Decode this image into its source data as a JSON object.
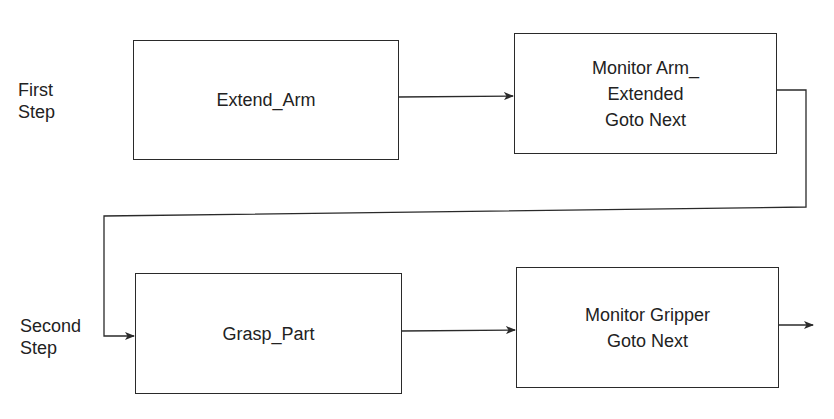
{
  "diagram": {
    "type": "flowchart",
    "steps": [
      {
        "label_lines": [
          "First",
          "Step"
        ],
        "boxes": [
          {
            "id": "extend_arm",
            "lines": [
              "Extend_Arm"
            ]
          },
          {
            "id": "monitor_arm_extended",
            "lines": [
              "Monitor Arm_",
              "Extended",
              "Goto Next"
            ]
          }
        ]
      },
      {
        "label_lines": [
          "Second",
          "Step"
        ],
        "boxes": [
          {
            "id": "grasp_part",
            "lines": [
              "Grasp_Part"
            ]
          },
          {
            "id": "monitor_gripper",
            "lines": [
              "Monitor Gripper",
              "Goto Next"
            ]
          }
        ]
      }
    ],
    "edges": [
      {
        "from": "extend_arm",
        "to": "monitor_arm_extended"
      },
      {
        "from": "monitor_arm_extended",
        "to": "grasp_part"
      },
      {
        "from": "grasp_part",
        "to": "monitor_gripper"
      },
      {
        "from": "monitor_gripper",
        "to": "next"
      }
    ],
    "colors": {
      "line": "#2a2a2a",
      "text": "#222222",
      "background": "#ffffff"
    }
  }
}
